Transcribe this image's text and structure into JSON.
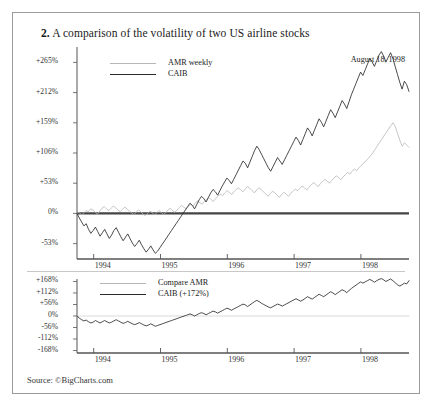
{
  "figure": {
    "number": "2.",
    "title": "A comparison of the volatility of two US airline stocks",
    "datestamp": "August 18, 1998",
    "source": "Source: ©BigCharts.com"
  },
  "colors": {
    "amr_line": "#b6b6b6",
    "caib_line": "#2a2a2a",
    "axis": "#555555",
    "baseline": "#444444",
    "border": "#9a9a9a"
  },
  "chart_data": [
    {
      "type": "line",
      "panel": "upper",
      "title": "A comparison of the volatility of two US airline stocks",
      "xlabel": "",
      "ylabel": "",
      "grid": false,
      "legend_position": "top-left",
      "xlim": [
        1993.75,
        1998.72
      ],
      "ylim": [
        -80,
        292
      ],
      "xticks": [
        1994,
        1995,
        1996,
        1997,
        1998
      ],
      "xticklabels": [
        "1994",
        "1995",
        "1996",
        "1997",
        "1998"
      ],
      "yticks": [
        265,
        212,
        159,
        106,
        53,
        0,
        -53
      ],
      "yticklabels": [
        "+265%",
        "+212%",
        "+159%",
        "+106%",
        "+53%",
        "0%",
        "-53%"
      ],
      "series": [
        {
          "name": "AMR weekly",
          "color": "#b6b6b6",
          "values": [
            0,
            2,
            -3,
            1,
            5,
            3,
            8,
            6,
            2,
            -1,
            4,
            9,
            12,
            8,
            5,
            9,
            13,
            10,
            6,
            3,
            7,
            11,
            8,
            4,
            1,
            -2,
            2,
            6,
            3,
            -1,
            -4,
            0,
            4,
            2,
            -3,
            1,
            5,
            2,
            -2,
            1,
            6,
            9,
            5,
            2,
            6,
            10,
            14,
            11,
            8,
            12,
            16,
            13,
            18,
            22,
            19,
            16,
            21,
            25,
            28,
            24,
            21,
            26,
            30,
            34,
            31,
            36,
            40,
            37,
            33,
            38,
            42,
            45,
            41,
            38,
            43,
            47,
            44,
            40,
            36,
            41,
            45,
            42,
            38,
            34,
            30,
            35,
            39,
            36,
            32,
            28,
            33,
            37,
            34,
            30,
            35,
            39,
            43,
            40,
            44,
            48,
            45,
            41,
            46,
            50,
            54,
            51,
            47,
            52,
            56,
            60,
            57,
            53,
            58,
            62,
            66,
            63,
            59,
            64,
            68,
            72,
            69,
            74,
            78,
            75,
            80,
            84,
            88,
            92,
            96,
            101,
            106,
            112,
            118,
            124,
            130,
            136,
            142,
            148,
            154,
            159,
            152,
            140,
            128,
            118,
            124,
            120,
            116
          ]
        },
        {
          "name": "CAIB",
          "color": "#2a2a2a",
          "values": [
            0,
            -8,
            -15,
            -22,
            -18,
            -28,
            -35,
            -30,
            -24,
            -32,
            -40,
            -34,
            -28,
            -36,
            -44,
            -38,
            -30,
            -25,
            -33,
            -41,
            -48,
            -42,
            -36,
            -44,
            -52,
            -58,
            -53,
            -47,
            -55,
            -62,
            -68,
            -63,
            -57,
            -64,
            -70,
            -66,
            -60,
            -54,
            -48,
            -42,
            -36,
            -30,
            -24,
            -18,
            -12,
            -6,
            0,
            6,
            12,
            18,
            14,
            8,
            16,
            24,
            30,
            26,
            20,
            28,
            36,
            42,
            38,
            32,
            40,
            48,
            55,
            62,
            58,
            52,
            60,
            68,
            76,
            84,
            92,
            88,
            80,
            90,
            100,
            110,
            118,
            112,
            104,
            96,
            88,
            80,
            74,
            82,
            90,
            98,
            92,
            86,
            94,
            102,
            110,
            118,
            126,
            134,
            128,
            120,
            130,
            140,
            150,
            144,
            136,
            146,
            156,
            166,
            160,
            152,
            162,
            172,
            182,
            176,
            168,
            178,
            188,
            198,
            192,
            184,
            196,
            208,
            218,
            228,
            238,
            248,
            242,
            252,
            262,
            272,
            266,
            258,
            268,
            278,
            284,
            276,
            266,
            274,
            282,
            272,
            258,
            244,
            230,
            218,
            232,
            226,
            214
          ]
        }
      ]
    },
    {
      "type": "line",
      "panel": "lower",
      "title": "",
      "xlabel": "",
      "ylabel": "",
      "grid": false,
      "legend_position": "top-left",
      "xlim": [
        1993.75,
        1998.72
      ],
      "ylim": [
        -180,
        180
      ],
      "xticks": [
        1994,
        1995,
        1996,
        1997,
        1998
      ],
      "xticklabels": [
        "1994",
        "1995",
        "1996",
        "1997",
        "1998"
      ],
      "yticks": [
        168,
        112,
        56,
        0,
        -56,
        -112,
        -168
      ],
      "yticklabels": [
        "+168%",
        "+112%",
        "+56%",
        "0%",
        "-56%",
        "-112%",
        "-168%"
      ],
      "series": [
        {
          "name": "Compare AMR",
          "color": "#cfcfcf",
          "values": [
            0,
            0,
            0,
            0,
            0,
            0,
            0,
            0,
            0,
            0,
            0,
            0,
            0,
            0,
            0,
            0,
            0,
            0,
            0,
            0,
            0,
            0,
            0,
            0,
            0,
            0,
            0,
            0,
            0,
            0,
            0,
            0,
            0,
            0,
            0,
            0,
            0,
            0,
            0,
            0,
            0,
            0,
            0,
            0,
            0,
            0,
            0,
            0,
            0,
            0,
            0,
            0,
            0,
            0,
            0,
            0,
            0,
            0,
            0,
            0,
            0,
            0,
            0,
            0,
            0,
            0,
            0,
            0,
            0,
            0,
            0,
            0,
            0,
            0,
            0,
            0,
            0,
            0,
            0,
            0,
            0,
            0,
            0,
            0,
            0,
            0,
            0,
            0,
            0,
            0,
            0,
            0,
            0,
            0,
            0,
            0,
            0,
            0,
            0,
            0,
            0,
            0,
            0,
            0,
            0,
            0,
            0,
            0,
            0,
            0,
            0,
            0,
            0,
            0,
            0,
            0,
            0,
            0,
            0,
            0,
            0,
            0,
            0,
            0,
            0,
            0,
            0,
            0,
            0,
            0,
            0,
            0,
            0,
            0,
            0,
            0,
            0,
            0,
            0,
            0,
            0
          ]
        },
        {
          "name": "CAIB (+172%)",
          "color": "#2a2a2a",
          "values": [
            0,
            -10,
            -18,
            -24,
            -20,
            -28,
            -34,
            -30,
            -22,
            -28,
            -34,
            -28,
            -22,
            -28,
            -34,
            -30,
            -24,
            -18,
            -24,
            -30,
            -36,
            -32,
            -26,
            -32,
            -38,
            -42,
            -38,
            -32,
            -38,
            -44,
            -48,
            -44,
            -38,
            -44,
            -50,
            -46,
            -42,
            -38,
            -34,
            -30,
            -26,
            -22,
            -18,
            -14,
            -10,
            -6,
            -2,
            2,
            6,
            10,
            6,
            0,
            6,
            12,
            16,
            12,
            6,
            12,
            18,
            24,
            20,
            14,
            20,
            26,
            32,
            38,
            34,
            28,
            34,
            40,
            46,
            52,
            58,
            54,
            46,
            54,
            62,
            70,
            76,
            70,
            62,
            56,
            50,
            44,
            40,
            46,
            52,
            58,
            54,
            48,
            54,
            60,
            66,
            72,
            78,
            84,
            78,
            72,
            78,
            86,
            94,
            88,
            82,
            90,
            98,
            106,
            100,
            94,
            102,
            110,
            118,
            112,
            104,
            112,
            120,
            128,
            122,
            114,
            124,
            134,
            142,
            150,
            158,
            166,
            160,
            166,
            172,
            178,
            172,
            164,
            172,
            178,
            182,
            176,
            168,
            174,
            180,
            172,
            162,
            152,
            146,
            152,
            160,
            156,
            172
          ]
        }
      ]
    }
  ]
}
